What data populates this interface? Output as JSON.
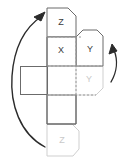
{
  "diagram": {
    "type": "cube-net-folding-diagram",
    "background_color": "#ffffff",
    "stroke_dark": "#6b6b6b",
    "stroke_gray": "#cfcfcf",
    "stroke_dash": "#9a9a9a",
    "arrow_color": "#2b2b2b",
    "panels": [
      {
        "id": "top",
        "label": "Z",
        "label_color": "#3a3a3a",
        "outline_color": "#6b6b6b",
        "style": "solid",
        "corner_cut": "top-right"
      },
      {
        "id": "center",
        "label": "X",
        "label_color": "#3a3a3a",
        "outline_color": "#6b6b6b",
        "style": "solid",
        "corner_cut": "none"
      },
      {
        "id": "right-upper",
        "label": "Y",
        "label_color": "#3a3a3a",
        "outline_color": "#6b6b6b",
        "style": "solid",
        "corner_cut": "top-right"
      },
      {
        "id": "right-lower",
        "label": "Y",
        "label_color": "#c9c9c9",
        "outline_color": "#cfcfcf",
        "style": "faded",
        "corner_cut": "bottom-right"
      },
      {
        "id": "left",
        "label": "",
        "label_color": "#3a3a3a",
        "outline_color": "#6b6b6b",
        "style": "solid",
        "corner_cut": "none"
      },
      {
        "id": "bottom-blank",
        "label": "",
        "label_color": "#3a3a3a",
        "outline_color": "#6b6b6b",
        "style": "solid",
        "corner_cut": "none"
      },
      {
        "id": "bottom",
        "label": "Z",
        "label_color": "#c9c9c9",
        "outline_color": "#cfcfcf",
        "style": "faded",
        "corner_cut": "top-right-and-bottom-right"
      }
    ],
    "arrows": [
      {
        "id": "left-arrow",
        "direction": "counter-clockwise-up",
        "head": "up-right",
        "color": "#2b2b2b"
      },
      {
        "id": "right-arrow",
        "direction": "clockwise-up",
        "head": "up",
        "color": "#2b2b2b"
      }
    ]
  }
}
